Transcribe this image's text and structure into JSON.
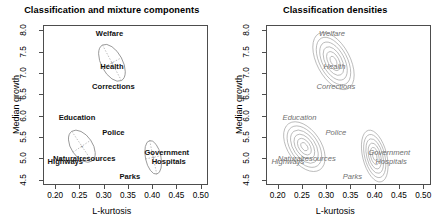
{
  "figure": {
    "panels": [
      {
        "id": "left",
        "title": "Classification and mixture components",
        "xlabel": "L-kurtosis",
        "ylabel": "Median growth"
      },
      {
        "id": "right",
        "title": "Classification densities",
        "xlabel": "L-kurtosis",
        "ylabel": "Median growth"
      }
    ]
  },
  "axes": {
    "x": {
      "min": 0.175,
      "max": 0.515,
      "ticks": [
        0.2,
        0.25,
        0.3,
        0.35,
        0.4,
        0.45,
        0.5
      ],
      "tick_labels": [
        "0.20",
        "0.25",
        "0.30",
        "0.35",
        "0.40",
        "0.45",
        "0.50"
      ],
      "label": "L-kurtosis"
    },
    "y": {
      "min": 4.38,
      "max": 8.12,
      "ticks": [
        4.5,
        5.0,
        5.5,
        6.0,
        6.5,
        7.0,
        7.5,
        8.0
      ],
      "tick_labels": [
        "4.5",
        "5.0",
        "5.5",
        "6.0",
        "6.5",
        "7.0",
        "7.5",
        "8.0"
      ],
      "label": "Median growth"
    }
  },
  "chart_data": {
    "type": "scatter",
    "xlabel": "L-kurtosis",
    "ylabel": "Median growth",
    "xlim": [
      0.175,
      0.515
    ],
    "ylim": [
      4.38,
      8.12
    ],
    "grid": false,
    "legend": "none",
    "points": [
      {
        "label": "Welfare",
        "x": 0.31,
        "y": 7.94,
        "cluster": 1
      },
      {
        "label": "Health",
        "x": 0.315,
        "y": 7.155,
        "cluster": 1
      },
      {
        "label": "Corrections",
        "x": 0.318,
        "y": 6.69,
        "cluster": 1
      },
      {
        "label": "Education",
        "x": 0.243,
        "y": 5.98,
        "cluster": 2
      },
      {
        "label": "Police",
        "x": 0.318,
        "y": 5.61,
        "cluster": 3
      },
      {
        "label": "Naturalresources",
        "x": 0.258,
        "y": 5.01,
        "cluster": 2
      },
      {
        "label": "Highways",
        "x": 0.219,
        "y": 4.93,
        "cluster": 2
      },
      {
        "label": "Government",
        "x": 0.428,
        "y": 5.155,
        "cluster": 3
      },
      {
        "label": "Hospitals",
        "x": 0.432,
        "y": 4.94,
        "cluster": 3
      },
      {
        "label": "Parks",
        "x": 0.352,
        "y": 4.585,
        "cluster": 3
      }
    ],
    "mixture_components": [
      {
        "id": 1,
        "center_x": 0.315,
        "center_y": 7.26,
        "rx": 0.022,
        "ry": 0.47,
        "angle_deg": -28,
        "members": [
          "Welfare",
          "Health",
          "Corrections"
        ]
      },
      {
        "id": 2,
        "center_x": 0.253,
        "center_y": 5.31,
        "rx": 0.022,
        "ry": 0.42,
        "angle_deg": -34,
        "members": [
          "Education",
          "Naturalresources",
          "Highways"
        ]
      },
      {
        "id": 3,
        "center_x": 0.4,
        "center_y": 5.05,
        "rx": 0.016,
        "ry": 0.4,
        "angle_deg": -12,
        "members": [
          "Police",
          "Government",
          "Hospitals",
          "Parks"
        ]
      }
    ],
    "density_contours": [
      {
        "id": 1,
        "center_x": 0.312,
        "center_y": 7.3,
        "levels": 6,
        "angle_deg": -28
      },
      {
        "id": 2,
        "center_x": 0.252,
        "center_y": 5.3,
        "levels": 6,
        "angle_deg": -34
      },
      {
        "id": 3,
        "center_x": 0.397,
        "center_y": 5.08,
        "levels": 6,
        "angle_deg": -14
      }
    ]
  },
  "colors": {
    "frame": "#4d4d4d",
    "ellipse": "#8c8c8c",
    "contour": "#9a9a9a",
    "label_left": "#111111",
    "label_right": "#6f6f6f",
    "background": "#ffffff"
  }
}
